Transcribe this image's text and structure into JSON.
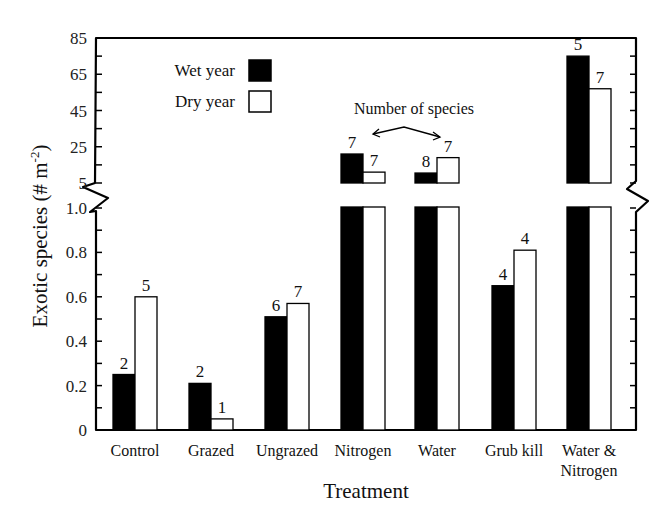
{
  "chart_data": {
    "type": "bar",
    "title": "",
    "xlabel": "Treatment",
    "ylabel": "Exotic species (# m-2)",
    "ylabel_parts": {
      "main": "Exotic species (# m",
      "sup": "-2",
      "end": ")"
    },
    "categories": [
      "Control",
      "Grazed",
      "Ungrazed",
      "Nitrogen",
      "Water",
      "Grub kill",
      "Water & Nitrogen"
    ],
    "category_lines": [
      [
        "Control"
      ],
      [
        "Grazed"
      ],
      [
        "Ungrazed"
      ],
      [
        "Nitrogen"
      ],
      [
        "Water"
      ],
      [
        "Grub kill"
      ],
      [
        "Water &",
        "Nitrogen"
      ]
    ],
    "series": [
      {
        "name": "Wet year",
        "color": "#000000",
        "values": [
          0.25,
          0.21,
          0.51,
          21,
          10.5,
          0.65,
          75
        ],
        "species_counts": [
          "2",
          "2",
          "6",
          "7",
          "8",
          "4",
          "5"
        ]
      },
      {
        "name": "Dry year",
        "color": "#ffffff",
        "values": [
          0.6,
          0.05,
          0.57,
          11,
          19,
          0.81,
          57
        ],
        "species_counts": [
          "5",
          "1",
          "7",
          "7",
          "7",
          "4",
          "7"
        ]
      }
    ],
    "axis": {
      "broken": true,
      "lower_range": [
        0,
        1.0
      ],
      "lower_ticks": [
        "0",
        "0.2",
        "0.4",
        "0.6",
        "0.8",
        "1.0"
      ],
      "upper_range": [
        5,
        85
      ],
      "upper_ticks": [
        "5",
        "25",
        "45",
        "65",
        "85"
      ]
    },
    "legend": {
      "position": "upper-left",
      "entries": [
        "Wet year",
        "Dry year"
      ]
    },
    "annotations": [
      {
        "text": "Number of species",
        "points_to": [
          "Nitrogen",
          "Water"
        ]
      }
    ],
    "grid": false
  }
}
